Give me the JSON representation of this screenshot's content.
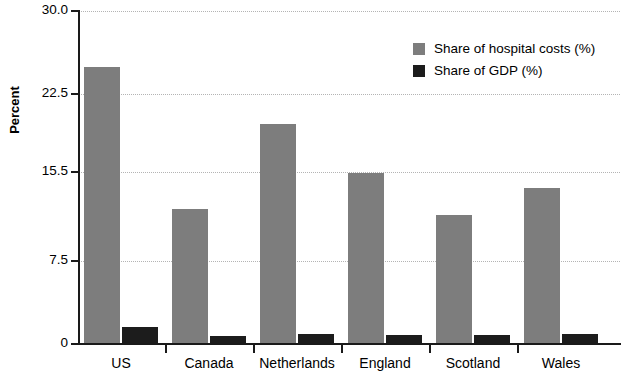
{
  "chart_data": {
    "type": "bar",
    "title": "",
    "xlabel": "",
    "ylabel": "Percent",
    "ylim": [
      0,
      30.0
    ],
    "grid": true,
    "legend_position": "top-right",
    "categories": [
      "US",
      "Canada",
      "Netherlands",
      "England",
      "Scotland",
      "Wales"
    ],
    "ytick_labels": [
      "30.0",
      "22.5",
      "15.5",
      "7.5",
      "0"
    ],
    "ytick_values": [
      30.0,
      22.5,
      15.5,
      7.5,
      0
    ],
    "series": [
      {
        "name": "Share of hospital costs (%)",
        "color": "#7d7d7d",
        "values": [
          25.0,
          12.2,
          19.8,
          15.4,
          11.6,
          14.1
        ]
      },
      {
        "name": "Share of GDP (%)",
        "color": "#1c1c1c",
        "values": [
          1.5,
          0.7,
          0.9,
          0.8,
          0.8,
          0.9
        ]
      }
    ]
  },
  "axis": {
    "y_title": "Percent"
  },
  "legend": {
    "items": [
      {
        "label": "Share of hospital costs (%)",
        "swatch": "host"
      },
      {
        "label": "Share of GDP (%)",
        "swatch": "gdp"
      }
    ]
  }
}
